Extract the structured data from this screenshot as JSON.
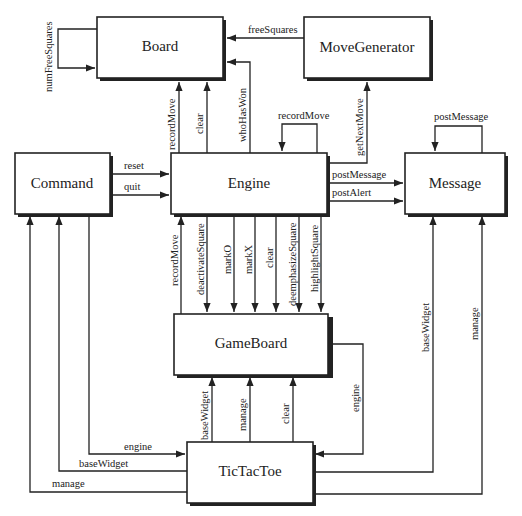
{
  "diagram": {
    "type": "class-collaboration-diagram",
    "nodes": [
      {
        "id": "board",
        "label": "Board"
      },
      {
        "id": "movegen",
        "label": "MoveGenerator"
      },
      {
        "id": "command",
        "label": "Command"
      },
      {
        "id": "engine",
        "label": "Engine"
      },
      {
        "id": "message",
        "label": "Message"
      },
      {
        "id": "gameboard",
        "label": "GameBoard"
      },
      {
        "id": "tictactoe",
        "label": "TicTacToe"
      }
    ],
    "edges": [
      {
        "from": "board",
        "to": "board",
        "label": "numFreeSquares"
      },
      {
        "from": "movegen",
        "to": "board",
        "label": "freeSquares"
      },
      {
        "from": "engine",
        "to": "board",
        "label": "recordMove"
      },
      {
        "from": "engine",
        "to": "board",
        "label": "clear"
      },
      {
        "from": "engine",
        "to": "board",
        "label": "whoHasWon"
      },
      {
        "from": "engine",
        "to": "engine",
        "label": "recordMove"
      },
      {
        "from": "engine",
        "to": "movegen",
        "label": "getNextMove"
      },
      {
        "from": "message",
        "to": "message",
        "label": "postMessage"
      },
      {
        "from": "command",
        "to": "engine",
        "label": "reset"
      },
      {
        "from": "command",
        "to": "engine",
        "label": "quit"
      },
      {
        "from": "engine",
        "to": "message",
        "label": "postMessage"
      },
      {
        "from": "engine",
        "to": "message",
        "label": "postAlert"
      },
      {
        "from": "gameboard",
        "to": "engine",
        "label": "recordMove"
      },
      {
        "from": "engine",
        "to": "gameboard",
        "label": "deactivateSquare"
      },
      {
        "from": "engine",
        "to": "gameboard",
        "label": "markO"
      },
      {
        "from": "engine",
        "to": "gameboard",
        "label": "markX"
      },
      {
        "from": "engine",
        "to": "gameboard",
        "label": "clear"
      },
      {
        "from": "engine",
        "to": "gameboard",
        "label": "deemphasizeSquare"
      },
      {
        "from": "engine",
        "to": "gameboard",
        "label": "highlightSquare"
      },
      {
        "from": "tictactoe",
        "to": "gameboard",
        "label": "baseWidget"
      },
      {
        "from": "tictactoe",
        "to": "gameboard",
        "label": "manage"
      },
      {
        "from": "tictactoe",
        "to": "gameboard",
        "label": "clear"
      },
      {
        "from": "gameboard",
        "to": "tictactoe",
        "label": "engine"
      },
      {
        "from": "command",
        "to": "tictactoe",
        "label": "engine"
      },
      {
        "from": "tictactoe",
        "to": "command",
        "label": "baseWidget"
      },
      {
        "from": "tictactoe",
        "to": "command",
        "label": "manage"
      },
      {
        "from": "tictactoe",
        "to": "message",
        "label": "baseWidget"
      },
      {
        "from": "tictactoe",
        "to": "message",
        "label": "manage"
      }
    ]
  }
}
